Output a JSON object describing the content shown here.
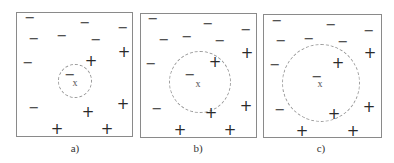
{
  "panels": [
    {
      "label": "a)",
      "box": {
        "left": 16,
        "top": 12,
        "right": 133,
        "bottom": 137
      },
      "query_point": {
        "symbol": "x",
        "x": 75,
        "y": 82
      },
      "query_class": {
        "symbol": "−",
        "x": 70,
        "y": 74
      },
      "circle": {
        "cx": 75,
        "cy": 81,
        "r": 17
      },
      "caption_pos": {
        "x": 75,
        "y": 148
      },
      "negatives": [
        [
          30,
          17
        ],
        [
          85,
          22
        ],
        [
          123,
          27
        ],
        [
          34,
          38
        ],
        [
          62,
          35
        ],
        [
          96,
          39
        ],
        [
          28,
          62
        ],
        [
          34,
          107
        ]
      ],
      "positives": [
        [
          124,
          52
        ],
        [
          91,
          61
        ],
        [
          123,
          104
        ],
        [
          88,
          112
        ],
        [
          57,
          129
        ],
        [
          107,
          129
        ]
      ]
    },
    {
      "label": "b)",
      "box": {
        "left": 140,
        "top": 13,
        "right": 257,
        "bottom": 138
      },
      "query_point": {
        "symbol": "x",
        "x": 198,
        "y": 83
      },
      "query_class": {
        "symbol": "−",
        "x": 190,
        "y": 74
      },
      "circle": {
        "cx": 200,
        "cy": 82,
        "r": 31
      },
      "caption_pos": {
        "x": 198,
        "y": 148
      },
      "negatives": [
        [
          153,
          18
        ],
        [
          208,
          23
        ],
        [
          246,
          29
        ],
        [
          164,
          39
        ],
        [
          187,
          36
        ],
        [
          220,
          40
        ],
        [
          151,
          63
        ],
        [
          157,
          108
        ]
      ],
      "positives": [
        [
          247,
          53
        ],
        [
          215,
          62
        ],
        [
          246,
          106
        ],
        [
          211,
          113
        ],
        [
          180,
          130
        ],
        [
          230,
          130
        ]
      ]
    },
    {
      "label": "c)",
      "box": {
        "left": 263,
        "top": 14,
        "right": 382,
        "bottom": 138
      },
      "query_point": {
        "symbol": "x",
        "x": 320,
        "y": 83
      },
      "query_class": {
        "symbol": "−",
        "x": 317,
        "y": 76
      },
      "circle": {
        "cx": 321,
        "cy": 83,
        "r": 39
      },
      "caption_pos": {
        "x": 321,
        "y": 148
      },
      "negatives": [
        [
          277,
          20
        ],
        [
          331,
          24
        ],
        [
          369,
          30
        ],
        [
          281,
          40
        ],
        [
          309,
          38
        ],
        [
          343,
          41
        ],
        [
          275,
          64
        ],
        [
          280,
          109
        ]
      ],
      "positives": [
        [
          370,
          53
        ],
        [
          338,
          63
        ],
        [
          369,
          107
        ],
        [
          334,
          114
        ],
        [
          302,
          131
        ],
        [
          353,
          131
        ]
      ]
    }
  ],
  "symbols": {
    "negative": "−",
    "positive": "+",
    "query": "x"
  }
}
